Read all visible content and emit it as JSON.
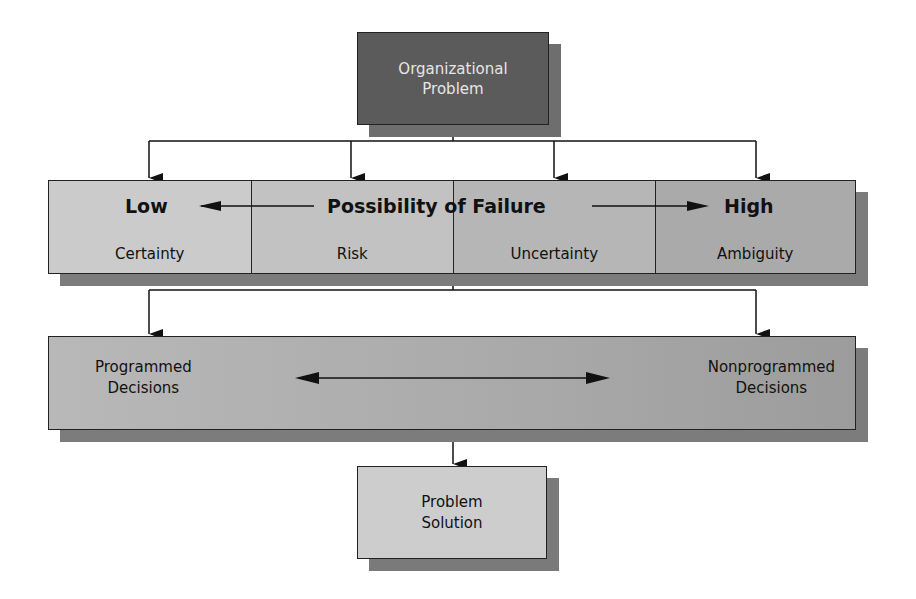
{
  "diagram": {
    "start_node": {
      "line1": "Organizational",
      "line2": "Problem",
      "fill": "#5b5b5b"
    },
    "possibility_scale": {
      "left_label": "Low",
      "center_label": "Possibility of Failure",
      "right_label": "High",
      "conditions": [
        {
          "label": "Certainty"
        },
        {
          "label": "Risk"
        },
        {
          "label": "Uncertainty"
        },
        {
          "label": "Ambiguity"
        }
      ]
    },
    "decision_types": {
      "left": {
        "line1": "Programmed",
        "line2": "Decisions"
      },
      "right": {
        "line1": "Nonprogrammed",
        "line2": "Decisions"
      }
    },
    "end_node": {
      "line1": "Problem",
      "line2": "Solution",
      "fill": "#cdcdcd"
    },
    "edges": [
      {
        "from": "Organizational Problem",
        "to": "Certainty"
      },
      {
        "from": "Organizational Problem",
        "to": "Risk"
      },
      {
        "from": "Organizational Problem",
        "to": "Uncertainty"
      },
      {
        "from": "Organizational Problem",
        "to": "Ambiguity"
      },
      {
        "from": "Possibility of Failure",
        "to": "Programmed Decisions"
      },
      {
        "from": "Possibility of Failure",
        "to": "Nonprogrammed Decisions"
      },
      {
        "from": "Decisions",
        "to": "Problem Solution"
      }
    ]
  }
}
